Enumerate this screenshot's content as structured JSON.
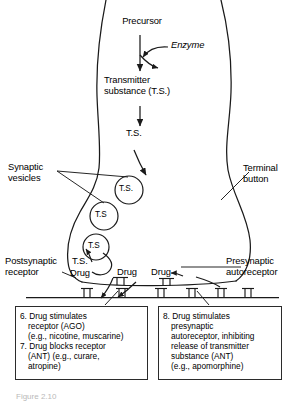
{
  "figure": {
    "domain_title": "Synaptic transmission and drug action at the synapse",
    "caption_partial": "Figure 2.10"
  },
  "pathway": {
    "precursor_label": "Precursor",
    "enzyme_label": "Enzyme",
    "transmitter_line1": "Transmitter",
    "transmitter_line2": "substance (T.S.)",
    "ts_label": "T.S."
  },
  "vesicles": [
    {
      "label": "T.S."
    },
    {
      "label": "T.S"
    },
    {
      "label": "T.S"
    }
  ],
  "released": {
    "ts_label": "T.S.",
    "drug_left": "Drug",
    "drug_mid": "Drug",
    "drug_right": "Drug"
  },
  "callouts": {
    "synaptic_vesicles_line1": "Synaptic",
    "synaptic_vesicles_line2": "vesicles",
    "terminal_button_line1": "Terminal",
    "terminal_button_line2": "button",
    "postsynaptic_receptor_line1": "Postsynaptic",
    "postsynaptic_receptor_line2": "receptor",
    "presynaptic_autoreceptor_line1": "Presynaptic",
    "presynaptic_autoreceptor_line2": "autoreceptor"
  },
  "note_boxes": {
    "left": {
      "lines": [
        "6. Drug stimulates",
        "receptor (AGO)",
        "(e.g., nicotine, muscarine)",
        "7. Drug blocks receptor",
        "(ANT) (e.g., curare,",
        "atropine)"
      ],
      "indent_flags": [
        false,
        true,
        true,
        false,
        true,
        true
      ]
    },
    "right": {
      "lines": [
        "8. Drug stimulates",
        "presynaptic",
        "autoreceptor, inhibiting",
        "release of transmitter",
        "substance (ANT)",
        "(e.g., apomorphine)"
      ],
      "indent_flags": [
        false,
        true,
        true,
        true,
        true,
        true
      ]
    }
  },
  "colors": {
    "ink": "#1a1a1a",
    "background": "#ffffff",
    "box_border": "#2b2b2b"
  },
  "counts": {
    "postsynaptic_receptors": 6,
    "presynaptic_autoreceptors": 2,
    "vesicles": 3
  }
}
